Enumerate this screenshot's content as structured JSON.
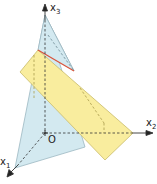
{
  "diagram": {
    "type": "3d-coordinate-system",
    "axes": {
      "x1": {
        "label": "x",
        "sub": "1"
      },
      "x2": {
        "label": "x",
        "sub": "2"
      },
      "x3": {
        "label": "x",
        "sub": "3"
      }
    },
    "origin_label": "O",
    "shapes": [
      {
        "name": "triangle-plane",
        "color": "#cfe6ee"
      },
      {
        "name": "parallelogram-plane",
        "color": "#f8ec9a"
      },
      {
        "name": "intersection-line",
        "color": "#d9533a"
      }
    ]
  }
}
